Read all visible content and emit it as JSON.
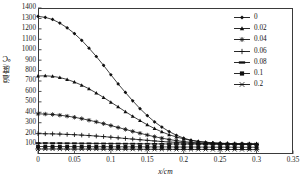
{
  "chart_data": {
    "type": "line",
    "title": "",
    "xlabel": "x/cm",
    "ylabel": "温度/℃",
    "xlim": [
      0,
      0.35
    ],
    "ylim": [
      0,
      1400
    ],
    "xticks": [
      "0",
      "0.05",
      "0.1",
      "0.15",
      "0.2",
      "0.25",
      "0.3",
      "0.35"
    ],
    "xtickvals": [
      0,
      0.05,
      0.1,
      0.15,
      0.2,
      0.25,
      0.3,
      0.35
    ],
    "yticks": [
      "100",
      "200",
      "300",
      "400",
      "500",
      "600",
      "700",
      "800",
      "900",
      "1000",
      "1100",
      "1200",
      "1300",
      "1400"
    ],
    "ytickvals": [
      100,
      200,
      300,
      400,
      500,
      600,
      700,
      800,
      900,
      1000,
      1100,
      1200,
      1300,
      1400
    ],
    "grid": false,
    "legend_position": "top-right",
    "legend_title": "",
    "x": [
      0,
      0.01,
      0.02,
      0.03,
      0.04,
      0.05,
      0.06,
      0.07,
      0.08,
      0.09,
      0.1,
      0.11,
      0.12,
      0.13,
      0.14,
      0.15,
      0.16,
      0.17,
      0.18,
      0.19,
      0.2,
      0.21,
      0.22,
      0.23,
      0.24,
      0.25,
      0.26,
      0.27,
      0.28,
      0.29,
      0.3
    ],
    "series": [
      {
        "name": "0",
        "marker": "diamond",
        "values": [
          1320,
          1310,
          1290,
          1255,
          1210,
          1155,
          1090,
          1015,
          935,
          850,
          760,
          672,
          590,
          510,
          435,
          368,
          308,
          258,
          215,
          180,
          152,
          132,
          120,
          112,
          106,
          102,
          100,
          98,
          97,
          96,
          95
        ]
      },
      {
        "name": "0.02",
        "marker": "triangle",
        "values": [
          748,
          750,
          745,
          733,
          715,
          690,
          660,
          625,
          585,
          542,
          497,
          452,
          406,
          362,
          320,
          280,
          244,
          212,
          185,
          163,
          145,
          131,
          121,
          113,
          108,
          104,
          101,
          99,
          98,
          97,
          96
        ]
      },
      {
        "name": "0.04",
        "marker": "asterisk",
        "values": [
          385,
          383,
          379,
          372,
          363,
          352,
          339,
          324,
          308,
          291,
          273,
          254,
          236,
          217,
          199,
          182,
          166,
          152,
          139,
          128,
          119,
          112,
          107,
          103,
          100,
          98,
          97,
          96,
          95,
          95,
          94
        ]
      },
      {
        "name": "0.06",
        "marker": "plus",
        "values": [
          195,
          194,
          193,
          191,
          188,
          185,
          181,
          177,
          172,
          167,
          161,
          155,
          149,
          143,
          137,
          131,
          125,
          120,
          115,
          111,
          107,
          104,
          101,
          99,
          98,
          97,
          96,
          95,
          95,
          94,
          94
        ]
      },
      {
        "name": "0.08",
        "marker": "dash",
        "values": [
          105,
          105,
          104,
          104,
          103,
          103,
          102,
          102,
          101,
          101,
          100,
          100,
          99,
          99,
          98,
          98,
          97,
          97,
          96,
          96,
          95,
          95,
          94,
          94,
          93,
          93,
          93,
          92,
          92,
          92,
          91
        ]
      },
      {
        "name": "0.1",
        "marker": "square",
        "values": [
          72,
          72,
          72,
          71,
          71,
          71,
          71,
          70,
          70,
          70,
          70,
          69,
          69,
          69,
          69,
          68,
          68,
          68,
          68,
          67,
          67,
          67,
          67,
          66,
          66,
          66,
          66,
          65,
          65,
          65,
          65
        ]
      },
      {
        "name": "0.2",
        "marker": "x-dash",
        "values": [
          48,
          48,
          48,
          48,
          47,
          47,
          47,
          47,
          47,
          46,
          46,
          46,
          46,
          46,
          45,
          45,
          45,
          45,
          45,
          44,
          44,
          44,
          44,
          44,
          43,
          43,
          43,
          43,
          43,
          42,
          42
        ]
      }
    ]
  },
  "legend": {
    "items": [
      {
        "label": "0",
        "marker": "diamond"
      },
      {
        "label": "0.02",
        "marker": "triangle"
      },
      {
        "label": "0.04",
        "marker": "asterisk"
      },
      {
        "label": "0.06",
        "marker": "plus"
      },
      {
        "label": "0.08",
        "marker": "dash"
      },
      {
        "label": "0.1",
        "marker": "square"
      },
      {
        "label": "0.2",
        "marker": "x-dash"
      }
    ]
  },
  "colors": {
    "line": "#111111",
    "frame": "#3a3a3a",
    "text": "#1a1a1a"
  }
}
